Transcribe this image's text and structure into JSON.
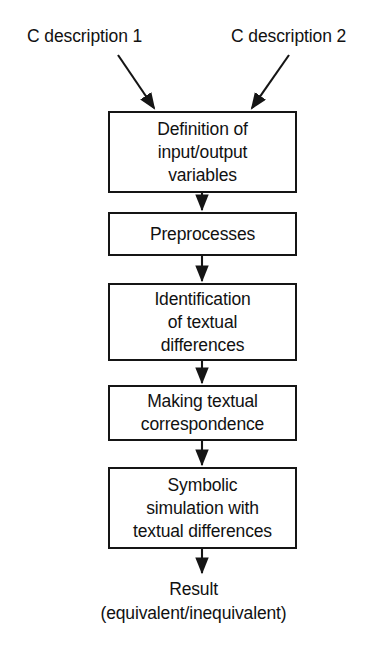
{
  "diagram": {
    "type": "flowchart",
    "orientation": "top-to-bottom",
    "title": "",
    "colors": {
      "background": "#ffffff",
      "stroke": "#151515",
      "text": "#111111"
    },
    "inputs": [
      {
        "id": "desc-1",
        "label": "C description 1"
      },
      {
        "id": "desc-2",
        "label": "C description 2"
      }
    ],
    "steps": [
      {
        "id": "definition",
        "label": "Definition of\ninput/output\nvariables"
      },
      {
        "id": "preprocess",
        "label": "Preprocesses"
      },
      {
        "id": "identify",
        "label": "Identification\nof textual\ndifferences"
      },
      {
        "id": "correspond",
        "label": "Making textual\ncorrespondence"
      },
      {
        "id": "simulation",
        "label": "Symbolic\nsimulation with\ntextual differences"
      }
    ],
    "terminal": {
      "id": "result",
      "line1": "Result",
      "line2": "(equivalent/inequivalent)"
    }
  }
}
